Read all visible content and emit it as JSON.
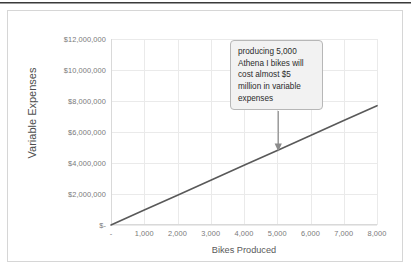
{
  "chart_data": {
    "type": "line",
    "title": "",
    "xlabel": "Bikes Produced",
    "ylabel": "Variable Expenses",
    "xlim": [
      0,
      8000
    ],
    "ylim": [
      0,
      12000000
    ],
    "grid": true,
    "legend": "none",
    "line_color": "#595959",
    "x": [
      0,
      1000,
      2000,
      3000,
      4000,
      5000,
      6000,
      7000,
      8000
    ],
    "values": [
      0,
      962500,
      1925000,
      2887500,
      3850000,
      4812500,
      5775000,
      6737500,
      7700000
    ],
    "series": [
      {
        "name": "Variable Expenses",
        "values": [
          0,
          962500,
          1925000,
          2887500,
          3850000,
          4812500,
          5775000,
          6737500,
          7700000
        ]
      }
    ],
    "xtick_labels": [
      "-",
      "1,000",
      "2,000",
      "3,000",
      "4,000",
      "5,000",
      "6,000",
      "7,000",
      "8,000"
    ],
    "xtick_values": [
      0,
      1000,
      2000,
      3000,
      4000,
      5000,
      6000,
      7000,
      8000
    ],
    "ytick_labels": [
      "$-",
      "$2,000,000",
      "$4,000,000",
      "$6,000,000",
      "$8,000,000",
      "$10,000,000",
      "$12,000,000"
    ],
    "ytick_values": [
      0,
      2000000,
      4000000,
      6000000,
      8000000,
      10000000,
      12000000
    ],
    "annotations": [
      {
        "text": "producing 5,000 Athena I bikes will cost almost $5 million in variable expenses",
        "lines": [
          "producing 5,000",
          "Athena I bikes will",
          "cost almost $5",
          "million in variable",
          "expenses"
        ],
        "points_to_x": 5000,
        "points_to_y": 4812500,
        "box_fill": "#f2f2f2",
        "box_border": "#b7b7b7",
        "arrow_color": "#8c8c8c"
      }
    ]
  }
}
